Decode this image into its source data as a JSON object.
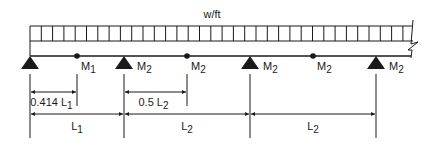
{
  "diagram": {
    "load_label": "w/ft",
    "supports": [
      {
        "x": 30,
        "label": ""
      },
      {
        "x": 124,
        "label_main": "M",
        "label_sub": "2"
      },
      {
        "x": 250,
        "label_main": "M",
        "label_sub": "2"
      },
      {
        "x": 376,
        "label_main": "M",
        "label_sub": "2"
      }
    ],
    "points": [
      {
        "x": 77,
        "label_main": "M",
        "label_sub": "1"
      },
      {
        "x": 187,
        "label_main": "M",
        "label_sub": "2"
      },
      {
        "x": 313,
        "label_main": "M",
        "label_sub": "2"
      }
    ],
    "dimensions": {
      "partial": [
        {
          "x1": 30,
          "x2": 77,
          "text_main": "0.414 L",
          "text_sub": "1"
        },
        {
          "x1": 124,
          "x2": 187,
          "text_main": "0.5 L",
          "text_sub": "2"
        }
      ],
      "spans": [
        {
          "x1": 30,
          "x2": 124,
          "text_main": "L",
          "text_sub": "1"
        },
        {
          "x1": 124,
          "x2": 250,
          "text_main": "L",
          "text_sub": "2"
        },
        {
          "x1": 250,
          "x2": 376,
          "text_main": "L",
          "text_sub": "2"
        }
      ]
    },
    "colors": {
      "ink": "#1a1a1a",
      "background": "#ffffff"
    }
  }
}
